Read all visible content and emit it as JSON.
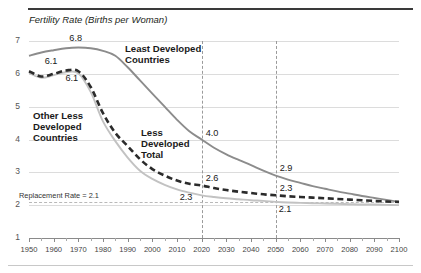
{
  "chart_data": {
    "type": "line",
    "title": "Fertility Rate (Births per Woman)",
    "xlabel": "",
    "ylabel": "",
    "xlim": [
      1950,
      2100
    ],
    "ylim": [
      1,
      7
    ],
    "grid": true,
    "legend_position": "inline-labels",
    "x_ticks": [
      "1950",
      "1960",
      "1970",
      "1980",
      "1990",
      "2000",
      "2010",
      "2020",
      "2030",
      "2040",
      "2050",
      "2060",
      "2070",
      "2080",
      "2090",
      "2100"
    ],
    "y_ticks": [
      "1",
      "2",
      "3",
      "4",
      "5",
      "6",
      "7"
    ],
    "x": [
      1950,
      1955,
      1960,
      1965,
      1970,
      1975,
      1980,
      1985,
      1990,
      1995,
      2000,
      2005,
      2010,
      2015,
      2020,
      2025,
      2030,
      2035,
      2040,
      2045,
      2050,
      2055,
      2060,
      2065,
      2070,
      2075,
      2080,
      2085,
      2090,
      2095,
      2100
    ],
    "series": [
      {
        "name": "Least Developed Countries",
        "color": "#8c8c8c",
        "style": "solid",
        "values": [
          6.55,
          6.65,
          6.72,
          6.78,
          6.8,
          6.78,
          6.7,
          6.55,
          6.2,
          5.8,
          5.4,
          5.0,
          4.6,
          4.25,
          4.0,
          3.75,
          3.55,
          3.38,
          3.22,
          3.05,
          2.9,
          2.78,
          2.68,
          2.58,
          2.5,
          2.42,
          2.35,
          2.28,
          2.22,
          2.16,
          2.1
        ]
      },
      {
        "name": "Less Developed Total",
        "color": "#2b2b2b",
        "style": "dashed",
        "values": [
          6.08,
          5.92,
          6.0,
          6.1,
          6.08,
          5.6,
          4.8,
          4.2,
          3.8,
          3.4,
          3.1,
          2.9,
          2.75,
          2.65,
          2.6,
          2.52,
          2.46,
          2.41,
          2.37,
          2.33,
          2.3,
          2.27,
          2.25,
          2.23,
          2.21,
          2.19,
          2.17,
          2.15,
          2.13,
          2.11,
          2.1
        ]
      },
      {
        "name": "Other Less Developed Countries",
        "color": "#c2c2c2",
        "style": "solid",
        "values": [
          6.02,
          5.88,
          5.96,
          6.05,
          6.02,
          5.45,
          4.55,
          3.95,
          3.45,
          3.05,
          2.8,
          2.62,
          2.48,
          2.38,
          2.3,
          2.25,
          2.21,
          2.18,
          2.15,
          2.13,
          2.1,
          2.08,
          2.07,
          2.06,
          2.05,
          2.04,
          2.03,
          2.02,
          2.02,
          2.01,
          2.0
        ]
      }
    ],
    "reference_line": {
      "label": "Replacement Rate = 2.1",
      "value": 2.1,
      "color": "#b9b9b9",
      "style": "dashed"
    },
    "vertical_markers": [
      {
        "x": 2020,
        "style": "dashed",
        "color": "#9a9a9a"
      },
      {
        "x": 2050,
        "style": "dashed",
        "color": "#9a9a9a"
      }
    ],
    "series_labels": [
      {
        "text_line_1": "Least Developed",
        "text_line_2": "Countries",
        "series": "Least Developed Countries"
      },
      {
        "text_line_1": "Less",
        "text_line_2": "Developed",
        "text_line_3": "Total",
        "series": "Less Developed Total"
      },
      {
        "text_line_1": "Other Less",
        "text_line_2": "Developed",
        "text_line_3": "Countries",
        "series": "Other Less Developed Countries"
      }
    ],
    "point_labels": [
      {
        "label": "6.8",
        "x": 1970,
        "y": 6.8,
        "series": "Least Developed Countries"
      },
      {
        "label": "6.1",
        "x": 1960,
        "y": 6.1,
        "series": "Less Developed Total"
      },
      {
        "label": "6.1",
        "x": 1968,
        "y": 6.1,
        "series": "Other Less Developed Countries"
      },
      {
        "label": "4.0",
        "x": 2020,
        "y": 4.0,
        "series": "Least Developed Countries"
      },
      {
        "label": "2.6",
        "x": 2020,
        "y": 2.6,
        "series": "Less Developed Total"
      },
      {
        "label": "2.3",
        "x": 2020,
        "y": 2.3,
        "series": "Other Less Developed Countries"
      },
      {
        "label": "2.9",
        "x": 2050,
        "y": 2.9,
        "series": "Least Developed Countries"
      },
      {
        "label": "2.3",
        "x": 2050,
        "y": 2.3,
        "series": "Less Developed Total"
      },
      {
        "label": "2.1",
        "x": 2050,
        "y": 2.1,
        "series": "Other Less Developed Countries"
      }
    ]
  }
}
